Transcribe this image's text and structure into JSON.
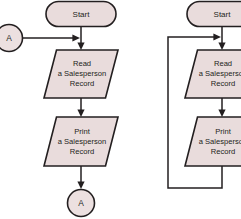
{
  "diagram": {
    "type": "flowchart",
    "background_color": "#ffffff",
    "shape_fill_color": "#e9dcdc",
    "line_color": "#231f20",
    "panels": [
      {
        "id": "left",
        "name": "connector-version",
        "nodes": [
          {
            "id": "left-connector-in",
            "shape": "connector-circle",
            "label": "A"
          },
          {
            "id": "left-start",
            "shape": "terminator",
            "label": "Start"
          },
          {
            "id": "left-read",
            "shape": "parallelogram",
            "label_lines": [
              "Read",
              "a Salesperson",
              "Record"
            ]
          },
          {
            "id": "left-print",
            "shape": "parallelogram",
            "label_lines": [
              "Print",
              "a Salesperson",
              "Record"
            ]
          },
          {
            "id": "left-connector-out",
            "shape": "connector-circle",
            "label": "A"
          }
        ],
        "edges": [
          {
            "from": "left-connector-in",
            "to": "left-start-flowline",
            "arrow": true
          },
          {
            "from": "left-start",
            "to": "left-read",
            "arrow": true
          },
          {
            "from": "left-read",
            "to": "left-print",
            "arrow": true
          },
          {
            "from": "left-print",
            "to": "left-connector-out",
            "arrow": true
          }
        ]
      },
      {
        "id": "right",
        "name": "loop-line-version",
        "nodes": [
          {
            "id": "right-start",
            "shape": "terminator",
            "label": "Start"
          },
          {
            "id": "right-read",
            "shape": "parallelogram",
            "label_lines": [
              "Read",
              "a Salesperson",
              "Record"
            ]
          },
          {
            "id": "right-print",
            "shape": "parallelogram",
            "label_lines": [
              "Print",
              "a Salesperson",
              "Record"
            ]
          }
        ],
        "edges": [
          {
            "from": "right-start",
            "to": "right-read",
            "arrow": true
          },
          {
            "from": "right-read",
            "to": "right-print",
            "arrow": true
          },
          {
            "from": "right-print",
            "to": "right-loop-return",
            "arrow": true,
            "style": "loop-back"
          }
        ]
      }
    ]
  },
  "labels": {
    "start": "Start",
    "connector_a": "A",
    "read_line1": "Read",
    "read_line2": "a Salesperson",
    "read_line3": "Record",
    "print_line1": "Print",
    "print_line2": "a Salesperson",
    "print_line3": "Record"
  }
}
